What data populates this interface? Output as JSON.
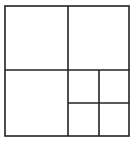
{
  "diagram": {
    "type": "square-subdivision",
    "stroke_color": "#222222",
    "background": "#ffffff",
    "outer": {
      "x": 5,
      "y": 6,
      "w": 124,
      "h": 130
    },
    "lines": [
      {
        "x1": 68,
        "y1": 6,
        "x2": 68,
        "y2": 136
      },
      {
        "x1": 5,
        "y1": 70,
        "x2": 129,
        "y2": 70
      },
      {
        "x1": 99,
        "y1": 70,
        "x2": 99,
        "y2": 136
      },
      {
        "x1": 68,
        "y1": 103,
        "x2": 129,
        "y2": 103
      }
    ],
    "regions": [
      "top-left",
      "top-right",
      "bottom-left",
      "bottom-right-top-left",
      "bottom-right-top-right",
      "bottom-right-bottom-left",
      "bottom-right-bottom-right"
    ]
  }
}
